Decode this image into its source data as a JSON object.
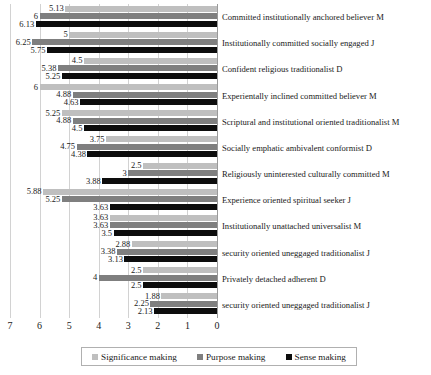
{
  "chart_data": {
    "type": "bar",
    "orientation": "horizontal",
    "title": "",
    "xlabel": "",
    "ylabel": "",
    "xlim": [
      7,
      0
    ],
    "x_axis_reversed": true,
    "grid": true,
    "legend_position": "bottom",
    "xticks": [
      "7",
      "6",
      "5",
      "4",
      "3",
      "2",
      "1",
      "0"
    ],
    "categories": [
      "Committed institutionally anchored believer M",
      "Institutionally committed socially engaged J",
      "Confident religious traditionalist D",
      "Experientally inclined committed believer M",
      "Scriptural and institutional oriented traditionalist M",
      "Socially emphatic ambivalent conformist D",
      "Religiously uninterested culturally committed M",
      "Experience oriented spiritual seeker J",
      "Institutionally unattached universalist M",
      "security oriented uneggaged traditionalist J",
      "Privately detached adherent D",
      "security oriented uneggaged traditionalist J"
    ],
    "series": [
      {
        "name": "Significance making",
        "color": "#bfbfbf",
        "values": [
          5.13,
          5,
          4.5,
          6,
          5.25,
          3.75,
          2.5,
          5.88,
          3.63,
          2.88,
          2.5,
          1.88
        ],
        "labels": [
          "5.13",
          "5",
          "4.5",
          "6",
          "5.25",
          "3.75",
          "2.5",
          "5.88",
          "3.63",
          "2.88",
          "2.5",
          "1.88"
        ]
      },
      {
        "name": "Purpose making",
        "color": "#7f7f7f",
        "values": [
          6,
          6.25,
          5.38,
          4.88,
          4.88,
          4.75,
          3,
          5.25,
          3.63,
          3.38,
          4,
          2.25
        ],
        "labels": [
          "6",
          "6.25",
          "5.38",
          "4.88",
          "4.88",
          "4.75",
          "3",
          "5.25",
          "3.63",
          "3.38",
          "4",
          "2.25"
        ]
      },
      {
        "name": "Sense making",
        "color": "#0d0d0d",
        "values": [
          6.13,
          5.75,
          5.25,
          4.63,
          4.5,
          4.38,
          3.88,
          3.63,
          3.5,
          3.13,
          2.5,
          2.13
        ],
        "labels": [
          "6.13",
          "5.75",
          "5.25",
          "4.63",
          "4.5",
          "4.38",
          "3.88",
          "3.63",
          "3.5",
          "3.13",
          "2.5",
          "2.13"
        ]
      }
    ]
  },
  "legend": {
    "items": [
      {
        "label": "Significance making",
        "swatch": "legend-swatch-significance"
      },
      {
        "label": "Purpose making",
        "swatch": "legend-swatch-purpose"
      },
      {
        "label": "Sense making",
        "swatch": "legend-swatch-sense"
      }
    ]
  }
}
